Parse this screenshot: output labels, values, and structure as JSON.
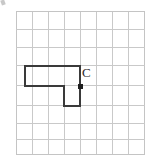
{
  "figure": {
    "type": "geometry-grid-figure",
    "background_color": "#ffffff",
    "grid": {
      "columns": 8,
      "rows": 8,
      "cell_size": 16,
      "origin_x": 16,
      "origin_y": 11,
      "line_color": "#c9c9c9",
      "line_width": 1,
      "border_color": "#c4c4c4"
    },
    "shape": {
      "name": "L-shape",
      "stroke_color": "#3a3a3a",
      "stroke_width": 2,
      "fill": "none",
      "vertices_px": [
        [
          25,
          66
        ],
        [
          80,
          66
        ],
        [
          80,
          106
        ],
        [
          64,
          106
        ],
        [
          64,
          86
        ],
        [
          25,
          86
        ]
      ],
      "vertices_grid": [
        [
          0.56,
          3.44
        ],
        [
          4.0,
          3.44
        ],
        [
          4.0,
          5.94
        ],
        [
          3.0,
          5.94
        ],
        [
          3.0,
          4.69
        ],
        [
          0.56,
          4.69
        ]
      ]
    },
    "points": [
      {
        "label": "C",
        "marker": "square-dot",
        "marker_color": "#1f1f1f",
        "marker_size": 4,
        "x": 80,
        "y": 86,
        "label_x": 82,
        "label_y": 66
      }
    ],
    "artifact": {
      "name": "corner-speck",
      "visible": true
    }
  }
}
